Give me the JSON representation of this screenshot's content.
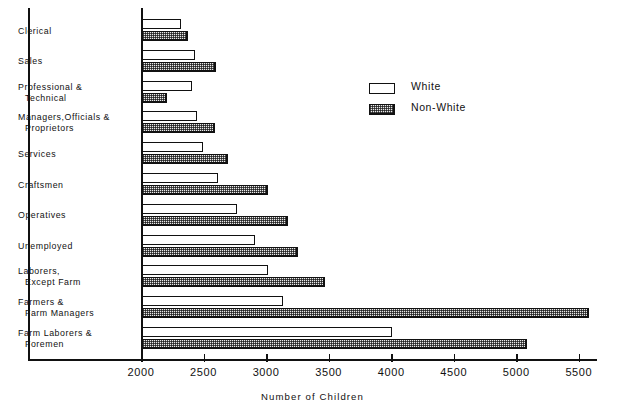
{
  "chart_data": {
    "type": "bar",
    "orientation": "horizontal",
    "title": "",
    "xlabel": "Number of Children",
    "ylabel": "",
    "xlim": [
      2000,
      5650
    ],
    "xticks": [
      2000,
      2500,
      3000,
      3500,
      4000,
      4500,
      5000,
      5500
    ],
    "xtick_labels": [
      "2000",
      "2500",
      "3000",
      "3500",
      "4000",
      "4500",
      "5000",
      "5500"
    ],
    "grid": false,
    "legend_position": "upper right",
    "categories": [
      "Clerical",
      "Sales",
      "Professional & Technical",
      "Managers,Officials & Proprietors",
      "Services",
      "Craftsmen",
      "Operatives",
      "Unemployed",
      "Laborers, Except Farm",
      "Farmers & Farm Managers",
      "Farm Laborers & Foremen"
    ],
    "category_lines": [
      [
        "Clerical"
      ],
      [
        "Sales"
      ],
      [
        "Professional  &",
        "Technical"
      ],
      [
        "Managers,Officials &",
        "Proprietors"
      ],
      [
        "Services"
      ],
      [
        "Craftsmen"
      ],
      [
        "Operatives"
      ],
      [
        "Unemployed"
      ],
      [
        "Laborers,",
        "Except Farm"
      ],
      [
        "Farmers &",
        "Farm Managers"
      ],
      [
        "Farm Laborers &",
        "Foremen"
      ]
    ],
    "series": [
      {
        "name": "White",
        "values": [
          2310,
          2420,
          2400,
          2440,
          2490,
          2610,
          2760,
          2900,
          3010,
          3130,
          4000
        ]
      },
      {
        "name": "Non-White",
        "values": [
          2370,
          2590,
          2200,
          2580,
          2690,
          3010,
          3170,
          3250,
          3460,
          5570,
          5080
        ]
      }
    ]
  },
  "legend": {
    "items": [
      {
        "label": "White",
        "swatch": "white-swatch"
      },
      {
        "label": "Non-White",
        "swatch": "hatched-swatch"
      }
    ]
  },
  "axis": {
    "xlabel": "Number of Children"
  }
}
